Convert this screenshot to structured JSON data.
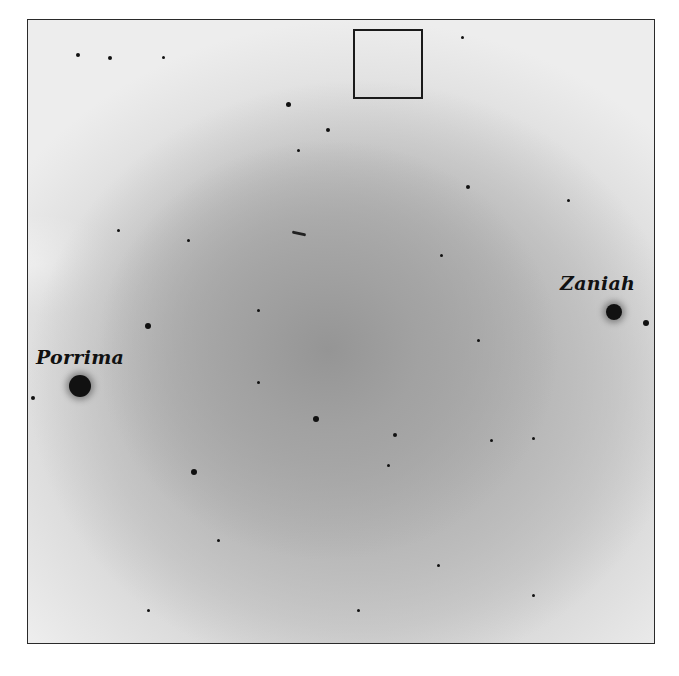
{
  "image": {
    "description": "Negative (inverted) photographic sky field with stars",
    "labels": {
      "porrima": "Porrima",
      "zaniah": "Zaniah"
    },
    "highlight_box": "square marker at top center of field",
    "caption": ""
  },
  "colors": {
    "background": "#ffffff",
    "field_center": "#959595",
    "field_edge": "#ededed",
    "star": "#111111",
    "frame": "#2a2a2a"
  },
  "stars": [
    {
      "x": 52,
      "y": 366,
      "r": 11,
      "type": "big",
      "name": "porrima-star"
    },
    {
      "x": 586,
      "y": 292,
      "r": 8,
      "type": "big",
      "name": "zaniah-star"
    },
    {
      "x": 618,
      "y": 303,
      "r": 3
    },
    {
      "x": 120,
      "y": 306,
      "r": 3
    },
    {
      "x": 166,
      "y": 452,
      "r": 3
    },
    {
      "x": 288,
      "y": 399,
      "r": 3
    },
    {
      "x": 260,
      "y": 84,
      "r": 2.5
    },
    {
      "x": 82,
      "y": 38,
      "r": 2
    },
    {
      "x": 50,
      "y": 35,
      "r": 2
    },
    {
      "x": 135,
      "y": 37,
      "r": 1.5
    },
    {
      "x": 300,
      "y": 110,
      "r": 2
    },
    {
      "x": 434,
      "y": 17,
      "r": 1.5
    },
    {
      "x": 440,
      "y": 167,
      "r": 2
    },
    {
      "x": 413,
      "y": 235,
      "r": 1.5
    },
    {
      "x": 367,
      "y": 415,
      "r": 2
    },
    {
      "x": 463,
      "y": 420,
      "r": 1.5
    },
    {
      "x": 505,
      "y": 418,
      "r": 1.5
    },
    {
      "x": 230,
      "y": 362,
      "r": 1.5
    },
    {
      "x": 270,
      "y": 130,
      "r": 1.5
    },
    {
      "x": 360,
      "y": 445,
      "r": 1.5
    },
    {
      "x": 410,
      "y": 545,
      "r": 1.5
    },
    {
      "x": 505,
      "y": 575,
      "r": 1.5
    },
    {
      "x": 230,
      "y": 290,
      "r": 1.5
    },
    {
      "x": 160,
      "y": 220,
      "r": 1.5
    },
    {
      "x": 90,
      "y": 210,
      "r": 1.5
    },
    {
      "x": 540,
      "y": 180,
      "r": 1.5
    },
    {
      "x": 450,
      "y": 320,
      "r": 1.5
    },
    {
      "x": 190,
      "y": 520,
      "r": 1.5
    },
    {
      "x": 120,
      "y": 590,
      "r": 1.5
    },
    {
      "x": 330,
      "y": 590,
      "r": 1.5
    },
    {
      "x": 5,
      "y": 378,
      "r": 2
    }
  ]
}
